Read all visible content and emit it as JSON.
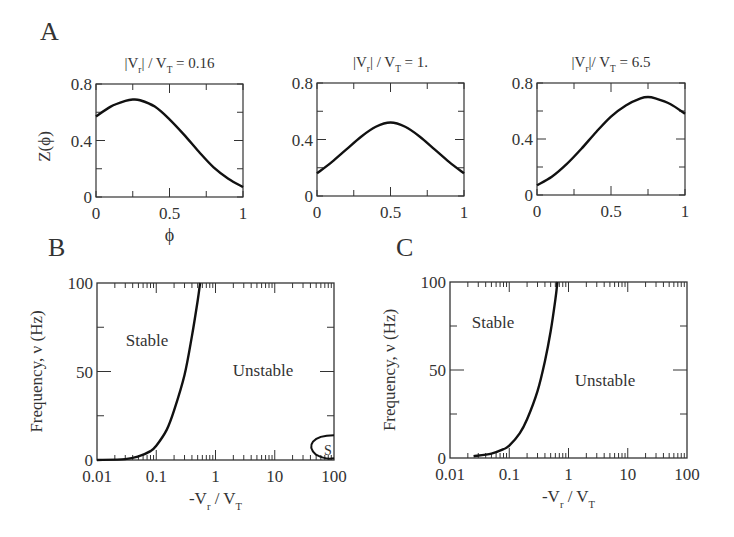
{
  "figure": {
    "panel_labels": {
      "A": "A",
      "B": "B",
      "C": "C"
    },
    "phase_axis_label": "ϕ",
    "z_axis_label": "Z(ϕ)",
    "freq_axis_label": "Frequency, ν (Hz)",
    "vr_axis_label_prefix": "-V",
    "vr_axis_label_sub1": "r",
    "vr_axis_label_mid": " / V",
    "vr_axis_label_sub2": "T",
    "region_stable": "Stable",
    "region_unstable": "Unstable",
    "region_s": "S"
  },
  "chart_data": [
    {
      "panel": "A1",
      "type": "line",
      "title": "|Vr| / VT = 0.16",
      "xlabel": "ϕ",
      "ylabel": "Z(ϕ)",
      "xlim": [
        0,
        1
      ],
      "ylim": [
        0,
        0.8
      ],
      "xticks": [
        "0",
        "0.5",
        "1"
      ],
      "yticks": [
        "0",
        "0.4",
        "0.8"
      ],
      "x": [
        0,
        0.1,
        0.2,
        0.25,
        0.3,
        0.4,
        0.5,
        0.6,
        0.7,
        0.8,
        0.9,
        1.0
      ],
      "y": [
        0.57,
        0.64,
        0.68,
        0.69,
        0.685,
        0.64,
        0.55,
        0.44,
        0.32,
        0.21,
        0.13,
        0.07
      ]
    },
    {
      "panel": "A2",
      "type": "line",
      "title": "|Vr| / VT = 1.",
      "xlabel": "ϕ",
      "ylabel": "Z(ϕ)",
      "xlim": [
        0,
        1
      ],
      "ylim": [
        0,
        0.8
      ],
      "xticks": [
        "0",
        "0.5",
        "1"
      ],
      "yticks": [
        "0",
        "0.4",
        "0.8"
      ],
      "x": [
        0,
        0.1,
        0.2,
        0.3,
        0.4,
        0.5,
        0.6,
        0.7,
        0.8,
        0.9,
        1.0
      ],
      "y": [
        0.16,
        0.24,
        0.33,
        0.42,
        0.49,
        0.52,
        0.49,
        0.42,
        0.33,
        0.24,
        0.16
      ]
    },
    {
      "panel": "A3",
      "type": "line",
      "title": "|Vr|/ VT = 6.5",
      "xlabel": "ϕ",
      "ylabel": "Z(ϕ)",
      "xlim": [
        0,
        1
      ],
      "ylim": [
        0,
        0.8
      ],
      "xticks": [
        "0",
        "0.5",
        "1"
      ],
      "yticks": [
        "0",
        "0.4",
        "0.8"
      ],
      "x": [
        0,
        0.1,
        0.2,
        0.3,
        0.4,
        0.5,
        0.6,
        0.7,
        0.75,
        0.8,
        0.9,
        1.0
      ],
      "y": [
        0.07,
        0.13,
        0.22,
        0.33,
        0.45,
        0.56,
        0.64,
        0.69,
        0.7,
        0.69,
        0.65,
        0.58
      ]
    },
    {
      "panel": "B",
      "type": "line",
      "xscale": "log",
      "xlabel": "-Vr / VT",
      "ylabel": "Frequency, ν (Hz)",
      "xlim": [
        0.01,
        100
      ],
      "ylim": [
        0,
        100
      ],
      "xticks": [
        "0.01",
        "0.1",
        "1",
        "10",
        "100"
      ],
      "yticks": [
        "0",
        "50",
        "100"
      ],
      "annotations": [
        "Stable",
        "Unstable",
        "S"
      ],
      "boundary": {
        "x": [
          0.01,
          0.03,
          0.05,
          0.08,
          0.1,
          0.15,
          0.2,
          0.3,
          0.4,
          0.5,
          0.55
        ],
        "y": [
          0,
          0.5,
          2,
          5,
          8,
          17,
          28,
          48,
          70,
          90,
          100
        ]
      },
      "s_region": {
        "x": [
          100,
          60,
          45,
          60,
          100
        ],
        "y": [
          14,
          12,
          6,
          1,
          0
        ]
      }
    },
    {
      "panel": "C",
      "type": "line",
      "xscale": "log",
      "xlabel": "-Vr / VT",
      "ylabel": "Frequency, ν (Hz)",
      "xlim": [
        0.01,
        100
      ],
      "ylim": [
        0,
        100
      ],
      "xticks": [
        "0.01",
        "0.1",
        "1",
        "10",
        "100"
      ],
      "yticks": [
        "0",
        "50",
        "100"
      ],
      "annotations": [
        "Stable",
        "Unstable"
      ],
      "boundary": {
        "x": [
          0.025,
          0.05,
          0.08,
          0.1,
          0.15,
          0.2,
          0.3,
          0.4,
          0.5,
          0.6,
          0.65
        ],
        "y": [
          1,
          2.5,
          5,
          7,
          14,
          22,
          38,
          55,
          72,
          90,
          100
        ]
      }
    }
  ]
}
